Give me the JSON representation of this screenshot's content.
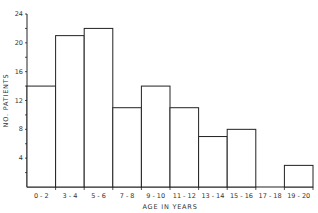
{
  "chart_data": {
    "type": "bar",
    "title": "",
    "xlabel": "AGE IN YEARS",
    "ylabel": "NO. PATIENTS",
    "categories": [
      "0-2",
      "3-4",
      "5-6",
      "7-8",
      "9-10",
      "11-12",
      "13-14",
      "15-16",
      "17-18",
      "19-20"
    ],
    "values": [
      14,
      21,
      22,
      11,
      14,
      11,
      7,
      8,
      0,
      3
    ],
    "ylim": [
      0,
      24
    ],
    "yticks": [
      4,
      8,
      12,
      16,
      20,
      24
    ],
    "grid": false,
    "legend": null
  }
}
